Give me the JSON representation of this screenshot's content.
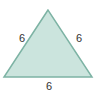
{
  "diagram": {
    "shape": "equilateral-triangle",
    "fill_color": "#cbe4dd",
    "stroke_color": "#7db3a4",
    "labels": {
      "left_side": "6",
      "right_side": "6",
      "bottom_side": "6"
    }
  }
}
